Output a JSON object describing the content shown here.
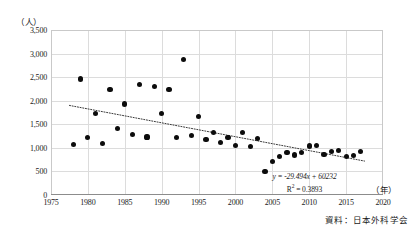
{
  "chart_data": {
    "type": "scatter",
    "title": "",
    "xlabel": "（年）",
    "ylabel": "（人）",
    "xlim": [
      1975,
      2020
    ],
    "ylim": [
      0,
      3500
    ],
    "grid": true,
    "legend": false,
    "x_ticks": [
      "1975",
      "1980",
      "1985",
      "1990",
      "1995",
      "2000",
      "2005",
      "2010",
      "2015",
      "2020"
    ],
    "x_tick_values": [
      1975,
      1980,
      1985,
      1990,
      1995,
      2000,
      2005,
      2010,
      2015,
      2020
    ],
    "y_ticks": [
      "0",
      "500",
      "1,000",
      "1,500",
      "2,000",
      "2,500",
      "3,000",
      "3,500"
    ],
    "y_tick_values": [
      0,
      500,
      1000,
      1500,
      2000,
      2500,
      3000,
      3500
    ],
    "point_color": "#0c0c0c",
    "gridline_color": "#dcdcdc",
    "series": [
      {
        "name": "観測値",
        "x": [
          1978,
          1979,
          1980,
          1981,
          1982,
          1983,
          1984,
          1985,
          1986,
          1987,
          1988,
          1989,
          1990,
          1991,
          1992,
          1993,
          1994,
          1995,
          1996,
          1997,
          1998,
          1999,
          2000,
          2001,
          2002,
          2003,
          2004,
          2005,
          2006,
          2007,
          2008,
          2009,
          2010,
          2011,
          2012,
          2013,
          2014,
          2015,
          2016,
          2017
        ],
        "values": [
          1075,
          2460,
          1215,
          1730,
          1090,
          2240,
          1415,
          1930,
          1285,
          2345,
          1230,
          2300,
          1725,
          2230,
          1215,
          2880,
          1270,
          1670,
          1170,
          1320,
          1115,
          1215,
          1045,
          1320,
          1025,
          1205,
          495,
          710,
          820,
          905,
          850,
          895,
          1040,
          1050,
          865,
          930,
          940,
          820,
          835,
          915
        ]
      }
    ],
    "trendline": {
      "type": "linear-dotted",
      "equation": "y = -29.494x + 60232",
      "r_squared_label": "R",
      "r_squared_exponent": "2",
      "r_squared_value": " = 0.3893",
      "slope": -29.494,
      "intercept": 60232,
      "r_squared": 0.3893,
      "x_start": 1977.5,
      "x_end": 2017.5,
      "y_start": 1900,
      "y_end": 720
    },
    "source_note": "資料：日本外科学会"
  }
}
